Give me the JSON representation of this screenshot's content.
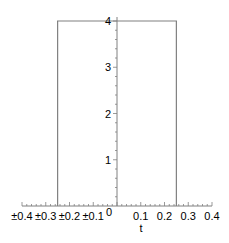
{
  "chart_data": {
    "type": "line",
    "title": "",
    "xlabel": "t",
    "ylabel": "",
    "xlim": [
      -0.4,
      0.4
    ],
    "ylim": [
      0,
      4
    ],
    "grid": false,
    "legend": null,
    "x_tick_labels": [
      "±0.4",
      "±0.3",
      "±0.2",
      "±0.1",
      "0",
      "0.1",
      "0.2",
      "0.3",
      "0.4"
    ],
    "x_ticks": [
      -0.4,
      -0.3,
      -0.2,
      -0.1,
      0,
      0.1,
      0.2,
      0.3,
      0.4
    ],
    "y_tick_labels": [
      "1",
      "2",
      "3",
      "4"
    ],
    "y_ticks": [
      1,
      2,
      3,
      4
    ],
    "series": [
      {
        "name": "rectangular pulse",
        "color": "#808080",
        "x": [
          -0.25,
          -0.25,
          0.25,
          0.25
        ],
        "y": [
          0,
          4,
          4,
          0
        ]
      }
    ]
  },
  "colors": {
    "axis": "#808080",
    "plot_line": "#808080",
    "text": "#000000"
  }
}
